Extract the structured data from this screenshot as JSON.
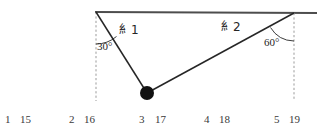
{
  "figure": {
    "type": "physics-diagram",
    "ceiling": {
      "x1": 95,
      "y1": 12,
      "x2": 317,
      "y2": 13,
      "color": "#4d4d4d"
    },
    "anchors": [
      {
        "name": "left-anchor",
        "x": 96,
        "y": 12
      },
      {
        "name": "right-anchor",
        "x": 294,
        "y": 13
      }
    ],
    "mass": {
      "label": "",
      "x": 147,
      "y": 93,
      "r": 7,
      "color": "#111111"
    },
    "strings": [
      {
        "name": "string-1",
        "label": "糹1",
        "from_x": 96,
        "from_y": 12,
        "to_x": 147,
        "to_y": 93,
        "angle_from_vertical": "30°"
      },
      {
        "name": "string-2",
        "label": "糹2",
        "from_x": 294,
        "from_y": 13,
        "to_x": 147,
        "to_y": 93,
        "angle_from_vertical": "60°"
      }
    ],
    "dashed_guides": [
      {
        "name": "left-vertical-guide",
        "x": 96,
        "y1": 12,
        "y2": 101
      },
      {
        "name": "right-vertical-guide",
        "x": 294,
        "y1": 13,
        "y2": 101
      }
    ],
    "angles": [
      {
        "name": "angle-left",
        "value": "30°",
        "x": 97,
        "y": 41
      },
      {
        "name": "angle-right",
        "value": "60°",
        "x": 264,
        "y": 37
      }
    ],
    "colors": {
      "line": "#262626",
      "ceiling": "#4d4d4d",
      "dashed": "#9b9b9b",
      "mass": "#111111",
      "text": "#262626",
      "numbers": "#3a3a3a",
      "background": "#ffffff"
    }
  },
  "number_row": [
    {
      "text": "1",
      "x": 5
    },
    {
      "text": "15",
      "x": 20
    },
    {
      "text": "2",
      "x": 69
    },
    {
      "text": "16",
      "x": 84
    },
    {
      "text": "3",
      "x": 139
    },
    {
      "text": "17",
      "x": 155
    },
    {
      "text": "4",
      "x": 204
    },
    {
      "text": "18",
      "x": 219
    },
    {
      "text": "5",
      "x": 274
    },
    {
      "text": "19",
      "x": 289
    }
  ]
}
